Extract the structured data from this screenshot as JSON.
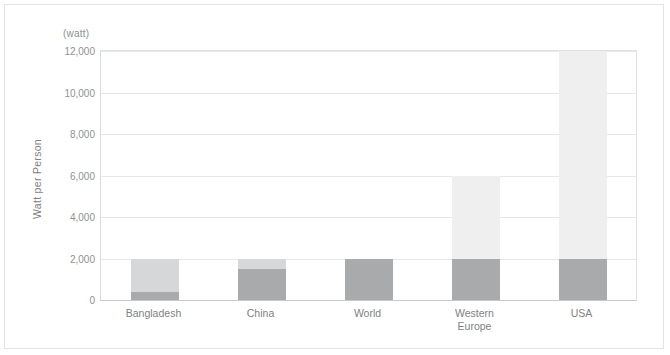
{
  "axis": {
    "unit_label": "(watt)",
    "y_title": "Watt per Person",
    "y_ticks": [
      "12,000",
      "10,000",
      "8,000",
      "6,000",
      "4,000",
      "2,000",
      "0"
    ]
  },
  "chart_data": {
    "type": "bar",
    "title": "",
    "xlabel": "",
    "ylabel": "Watt per Person",
    "unit": "(watt)",
    "ylim": [
      0,
      12000
    ],
    "ytick_values": [
      0,
      2000,
      4000,
      6000,
      8000,
      10000,
      12000
    ],
    "grid": true,
    "legend": "none",
    "stacked": true,
    "categories": [
      "Bangladesh",
      "China",
      "World",
      "Western Europe",
      "USA"
    ],
    "series": [
      {
        "name": "lower",
        "color": "#a9aaab",
        "values": [
          400,
          1500,
          2000,
          2000,
          2000
        ]
      },
      {
        "name": "upper",
        "color": "#d6d7d8",
        "values": [
          1600,
          500,
          0,
          4000,
          10000
        ]
      }
    ],
    "totals": [
      2000,
      2000,
      2000,
      6000,
      12000
    ]
  }
}
